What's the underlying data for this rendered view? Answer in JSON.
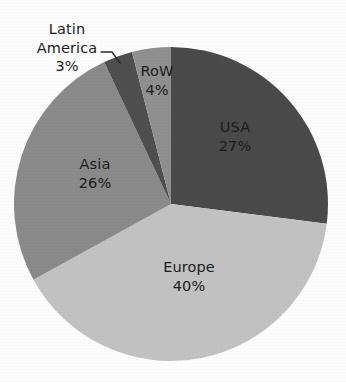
{
  "chart_data": {
    "type": "pie",
    "title": "",
    "subtitle": "",
    "xlabel": "",
    "ylabel": "",
    "legend_position": "none",
    "grid": false,
    "labels_inside_slices": true,
    "start_angle_deg": 0,
    "direction": "clockwise",
    "categories": [
      "USA",
      "Europe",
      "Asia",
      "Latin America",
      "RoW"
    ],
    "values": [
      27,
      40,
      26,
      3,
      4
    ],
    "unit": "%",
    "slices": [
      {
        "name": "USA",
        "value": 27,
        "value_text": "27%",
        "color": "#4a4a4a",
        "label_placement": "inside"
      },
      {
        "name": "Europe",
        "value": 40,
        "value_text": "40%",
        "color": "#c2c2c2",
        "label_placement": "inside"
      },
      {
        "name": "Asia",
        "value": 26,
        "value_text": "26%",
        "color": "#8a8a8a",
        "label_placement": "inside"
      },
      {
        "name": "Latin America",
        "value": 3,
        "value_text": "3%",
        "color": "#4f4f4f",
        "label_placement": "outside-with-leader"
      },
      {
        "name": "RoW",
        "value": 4,
        "value_text": "4%",
        "color": "#909090",
        "label_placement": "inside"
      }
    ]
  },
  "labels": {
    "usa": {
      "name": "USA",
      "value": "27%"
    },
    "europe": {
      "name": "Europe",
      "value": "40%"
    },
    "asia": {
      "name": "Asia",
      "value": "26%"
    },
    "row": {
      "name": "RoW",
      "value": "4%"
    },
    "latin": {
      "line1": "Latin",
      "line2": "America",
      "value": "3%"
    }
  },
  "colors": {
    "background": "#fdfdfd",
    "usa": "#4a4a4a",
    "europe": "#c2c2c2",
    "asia": "#8a8a8a",
    "latin_america": "#4f4f4f",
    "row": "#909090",
    "leader_line": "#2b2b2b",
    "label_text": "#1c1c1c"
  }
}
